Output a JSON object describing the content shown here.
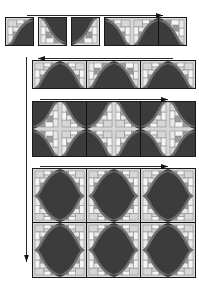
{
  "figure": {
    "background_color": "#ffffff",
    "palette": {
      "dark": "#3c3c3c",
      "mid_dark": "#6e6e6e",
      "mid": "#9a9a9a",
      "light": "#d6d6d6",
      "lighter": "#e8e8e8",
      "white": "#f5f5f5",
      "outline": "#1a1a1a",
      "arrow": "#111111"
    },
    "tile_size_px": 27,
    "stages": [
      {
        "name": "stage-1",
        "label": "Stage 1",
        "rows": 1,
        "blocks": [
          {
            "name": "block-1a",
            "cols": 1,
            "rows": 1,
            "x": 5,
            "y": 17,
            "tiles": [
              0
            ]
          },
          {
            "name": "block-1b",
            "cols": 1,
            "rows": 1,
            "x": 38,
            "y": 17,
            "tiles": [
              1
            ]
          },
          {
            "name": "block-1c",
            "cols": 1,
            "rows": 1,
            "x": 71,
            "y": 17,
            "tiles": [
              2
            ]
          },
          {
            "name": "block-1d",
            "cols": 3,
            "rows": 1,
            "x": 104,
            "y": 17,
            "tiles": [
              3,
              4,
              5
            ]
          }
        ]
      },
      {
        "name": "stage-2",
        "label": "Stage 2",
        "rows": 1,
        "blocks": [
          {
            "name": "block-2",
            "cols": 6,
            "rows": 1,
            "x": 32,
            "y": 60,
            "tiles": [
              6,
              7,
              8,
              9,
              10,
              11
            ]
          }
        ]
      },
      {
        "name": "stage-3",
        "label": "Stage 3",
        "rows": 2,
        "blocks": [
          {
            "name": "block-3",
            "cols": 6,
            "rows": 2,
            "x": 32,
            "y": 101,
            "tiles": [
              12,
              13,
              14,
              15,
              16,
              17,
              18,
              19,
              20,
              21,
              22,
              23
            ]
          }
        ]
      },
      {
        "name": "stage-4",
        "label": "Stage 4",
        "rows": 4,
        "blocks": [
          {
            "name": "block-4",
            "cols": 6,
            "rows": 4,
            "x": 32,
            "y": 168,
            "tiles": [
              24,
              25,
              26,
              27,
              28,
              29,
              30,
              31,
              32,
              33,
              34,
              35,
              36,
              37,
              38,
              39,
              40,
              41,
              42,
              43,
              44,
              45,
              46,
              47
            ]
          }
        ]
      }
    ],
    "arrows": [
      {
        "name": "arrow-stage-1",
        "direction": "right",
        "x": 27,
        "y": 11,
        "length": 136,
        "orientation": "horizontal"
      },
      {
        "name": "arrow-stage-2",
        "direction": "left",
        "x": 38,
        "y": 54,
        "length": 135,
        "orientation": "horizontal"
      },
      {
        "name": "arrow-stage-3",
        "direction": "right",
        "x": 40,
        "y": 95,
        "length": 128,
        "orientation": "horizontal"
      },
      {
        "name": "arrow-stage-4",
        "direction": "right",
        "x": 40,
        "y": 162,
        "length": 128,
        "orientation": "horizontal"
      },
      {
        "name": "arrow-vertical-growth",
        "direction": "down",
        "x": 22,
        "y": 57,
        "length": 205,
        "orientation": "vertical"
      }
    ]
  },
  "tile_variants": [
    {
      "id": 0,
      "curve": "s-up",
      "flip_x": false,
      "flip_y": false,
      "mosaic_corner": "top-left"
    },
    {
      "id": 1,
      "curve": "s-down",
      "flip_x": false,
      "flip_y": false,
      "mosaic_corner": "top-right"
    },
    {
      "id": 2,
      "curve": "s-down",
      "flip_x": true,
      "flip_y": false,
      "mosaic_corner": "bottom-left"
    },
    {
      "id": 3,
      "curve": "s-up",
      "flip_x": true,
      "flip_y": false,
      "mosaic_corner": "top-right"
    },
    {
      "id": 4,
      "curve": "s-up",
      "flip_x": false,
      "flip_y": false,
      "mosaic_corner": "top-left"
    },
    {
      "id": 5,
      "curve": "s-down",
      "flip_x": true,
      "flip_y": true,
      "mosaic_corner": "bottom-right"
    },
    {
      "id": 6,
      "curve": "s-up",
      "flip_x": false,
      "flip_y": false,
      "mosaic_corner": "top-left"
    },
    {
      "id": 7,
      "curve": "s-up",
      "flip_x": true,
      "flip_y": false,
      "mosaic_corner": "top-right"
    },
    {
      "id": 8,
      "curve": "s-down",
      "flip_x": false,
      "flip_y": true,
      "mosaic_corner": "bottom-left"
    },
    {
      "id": 9,
      "curve": "s-down",
      "flip_x": true,
      "flip_y": true,
      "mosaic_corner": "bottom-right"
    },
    {
      "id": 10,
      "curve": "s-up",
      "flip_x": false,
      "flip_y": false,
      "mosaic_corner": "top-left"
    },
    {
      "id": 11,
      "curve": "s-up",
      "flip_x": true,
      "flip_y": false,
      "mosaic_corner": "top-right"
    },
    {
      "id": 12,
      "curve": "s-down",
      "flip_x": true,
      "flip_y": false,
      "mosaic_corner": "bottom-left"
    },
    {
      "id": 13,
      "curve": "s-up",
      "flip_x": false,
      "flip_y": true,
      "mosaic_corner": "bottom-left"
    },
    {
      "id": 14,
      "curve": "s-up",
      "flip_x": true,
      "flip_y": true,
      "mosaic_corner": "bottom-right"
    },
    {
      "id": 15,
      "curve": "s-up",
      "flip_x": false,
      "flip_y": true,
      "mosaic_corner": "bottom-left"
    },
    {
      "id": 16,
      "curve": "s-up",
      "flip_x": true,
      "flip_y": true,
      "mosaic_corner": "bottom-right"
    },
    {
      "id": 17,
      "curve": "s-down",
      "flip_x": false,
      "flip_y": false,
      "mosaic_corner": "top-right"
    },
    {
      "id": 18,
      "curve": "s-down",
      "flip_x": true,
      "flip_y": true,
      "mosaic_corner": "bottom-right"
    },
    {
      "id": 19,
      "curve": "s-up",
      "flip_x": false,
      "flip_y": false,
      "mosaic_corner": "top-left"
    },
    {
      "id": 20,
      "curve": "s-up",
      "flip_x": true,
      "flip_y": false,
      "mosaic_corner": "top-right"
    },
    {
      "id": 21,
      "curve": "s-up",
      "flip_x": false,
      "flip_y": false,
      "mosaic_corner": "top-left"
    },
    {
      "id": 22,
      "curve": "s-up",
      "flip_x": true,
      "flip_y": false,
      "mosaic_corner": "top-right"
    },
    {
      "id": 23,
      "curve": "s-down",
      "flip_x": false,
      "flip_y": true,
      "mosaic_corner": "bottom-left"
    },
    {
      "id": 24,
      "curve": "s-up",
      "flip_x": false,
      "flip_y": false,
      "mosaic_corner": "top-left"
    },
    {
      "id": 25,
      "curve": "s-up",
      "flip_x": true,
      "flip_y": false,
      "mosaic_corner": "top-right"
    },
    {
      "id": 26,
      "curve": "s-up",
      "flip_x": false,
      "flip_y": false,
      "mosaic_corner": "top-left"
    },
    {
      "id": 27,
      "curve": "s-up",
      "flip_x": true,
      "flip_y": false,
      "mosaic_corner": "top-right"
    },
    {
      "id": 28,
      "curve": "s-up",
      "flip_x": false,
      "flip_y": false,
      "mosaic_corner": "top-left"
    },
    {
      "id": 29,
      "curve": "s-up",
      "flip_x": true,
      "flip_y": false,
      "mosaic_corner": "top-right"
    },
    {
      "id": 30,
      "curve": "s-up",
      "flip_x": false,
      "flip_y": true,
      "mosaic_corner": "bottom-left"
    },
    {
      "id": 31,
      "curve": "s-up",
      "flip_x": true,
      "flip_y": true,
      "mosaic_corner": "bottom-right"
    },
    {
      "id": 32,
      "curve": "s-up",
      "flip_x": false,
      "flip_y": true,
      "mosaic_corner": "bottom-left"
    },
    {
      "id": 33,
      "curve": "s-up",
      "flip_x": true,
      "flip_y": true,
      "mosaic_corner": "bottom-right"
    },
    {
      "id": 34,
      "curve": "s-up",
      "flip_x": false,
      "flip_y": true,
      "mosaic_corner": "bottom-left"
    },
    {
      "id": 35,
      "curve": "s-up",
      "flip_x": true,
      "flip_y": true,
      "mosaic_corner": "bottom-right"
    },
    {
      "id": 36,
      "curve": "s-up",
      "flip_x": false,
      "flip_y": false,
      "mosaic_corner": "top-left"
    },
    {
      "id": 37,
      "curve": "s-up",
      "flip_x": true,
      "flip_y": false,
      "mosaic_corner": "top-right"
    },
    {
      "id": 38,
      "curve": "s-up",
      "flip_x": false,
      "flip_y": false,
      "mosaic_corner": "top-left"
    },
    {
      "id": 39,
      "curve": "s-up",
      "flip_x": true,
      "flip_y": false,
      "mosaic_corner": "top-right"
    },
    {
      "id": 40,
      "curve": "s-up",
      "flip_x": false,
      "flip_y": false,
      "mosaic_corner": "top-left"
    },
    {
      "id": 41,
      "curve": "s-up",
      "flip_x": true,
      "flip_y": false,
      "mosaic_corner": "top-right"
    },
    {
      "id": 42,
      "curve": "s-up",
      "flip_x": false,
      "flip_y": true,
      "mosaic_corner": "bottom-left"
    },
    {
      "id": 43,
      "curve": "s-up",
      "flip_x": true,
      "flip_y": true,
      "mosaic_corner": "bottom-right"
    },
    {
      "id": 44,
      "curve": "s-up",
      "flip_x": false,
      "flip_y": true,
      "mosaic_corner": "bottom-left"
    },
    {
      "id": 45,
      "curve": "s-up",
      "flip_x": true,
      "flip_y": true,
      "mosaic_corner": "bottom-right"
    },
    {
      "id": 46,
      "curve": "s-up",
      "flip_x": false,
      "flip_y": true,
      "mosaic_corner": "bottom-left"
    },
    {
      "id": 47,
      "curve": "s-up",
      "flip_x": true,
      "flip_y": true,
      "mosaic_corner": "bottom-right"
    }
  ],
  "mosaic_cells": [
    {
      "x": 2,
      "y": 2,
      "w": 9,
      "h": 7,
      "tone": "light"
    },
    {
      "x": 11,
      "y": 2,
      "w": 7,
      "h": 4,
      "tone": "white"
    },
    {
      "x": 18,
      "y": 2,
      "w": 7,
      "h": 7,
      "tone": "mid"
    },
    {
      "x": 2,
      "y": 9,
      "w": 5,
      "h": 8,
      "tone": "white"
    },
    {
      "x": 7,
      "y": 9,
      "w": 8,
      "h": 5,
      "tone": "lighter"
    },
    {
      "x": 11,
      "y": 6,
      "w": 7,
      "h": 3,
      "tone": "light"
    },
    {
      "x": 15,
      "y": 9,
      "w": 10,
      "h": 6,
      "tone": "white"
    },
    {
      "x": 7,
      "y": 14,
      "w": 6,
      "h": 6,
      "tone": "mid"
    },
    {
      "x": 13,
      "y": 15,
      "w": 6,
      "h": 5,
      "tone": "lighter"
    },
    {
      "x": 19,
      "y": 15,
      "w": 6,
      "h": 6,
      "tone": "light"
    },
    {
      "x": 2,
      "y": 17,
      "w": 5,
      "h": 8,
      "tone": "lighter"
    },
    {
      "x": 7,
      "y": 20,
      "w": 8,
      "h": 5,
      "tone": "white"
    },
    {
      "x": 15,
      "y": 21,
      "w": 10,
      "h": 4,
      "tone": "mid"
    }
  ]
}
